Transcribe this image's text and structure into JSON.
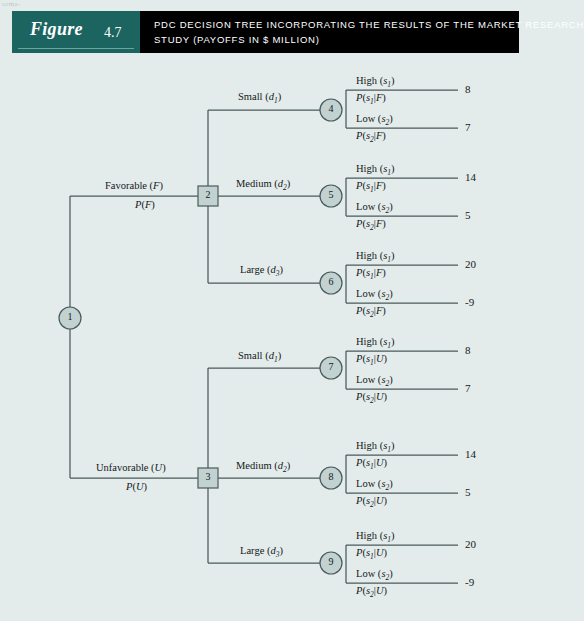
{
  "artifact_text": "orma-",
  "header": {
    "figure_word": "Figure",
    "figure_number": "4.7",
    "title_line1": "PDC DECISION TREE INCORPORATING THE RESULTS OF THE MARKET RESEARCH",
    "title_line2": "STUDY (PAYOFFS IN $ MILLION)",
    "colors": {
      "figure_block": "#1c6460",
      "title_block": "#000000",
      "page_background": "#e3eceb"
    }
  },
  "tree": {
    "nodes": [
      {
        "id": "1",
        "label": "1",
        "shape": "circle",
        "x": 70,
        "y": 318
      },
      {
        "id": "2",
        "label": "2",
        "shape": "square",
        "x": 208,
        "y": 196
      },
      {
        "id": "3",
        "label": "3",
        "shape": "square",
        "x": 208,
        "y": 478
      },
      {
        "id": "4",
        "label": "4",
        "shape": "circle",
        "x": 331,
        "y": 110
      },
      {
        "id": "5",
        "label": "5",
        "shape": "circle",
        "x": 331,
        "y": 196
      },
      {
        "id": "6",
        "label": "6",
        "shape": "circle",
        "x": 331,
        "y": 283
      },
      {
        "id": "7",
        "label": "7",
        "shape": "circle",
        "x": 331,
        "y": 368
      },
      {
        "id": "8",
        "label": "8",
        "shape": "circle",
        "x": 331,
        "y": 478
      },
      {
        "id": "9",
        "label": "9",
        "shape": "circle",
        "x": 331,
        "y": 563
      }
    ],
    "market_research_branches": [
      {
        "above": "Favorable (F)",
        "above_html": "Favorable (<i>F</i>)",
        "below": "P(F)",
        "below_html": "<i>P</i>(<i>F</i>)",
        "x": 105,
        "y": 196
      },
      {
        "above": "Unfavorable (U)",
        "above_html": "Unfavorable (<i>U</i>)",
        "below": "P(U)",
        "below_html": "<i>P</i>(<i>U</i>)",
        "x": 96,
        "y": 478
      }
    ],
    "decision_branches": [
      {
        "label": "Small (d1)",
        "label_html": "Small (<i>d</i><sub>1</sub>)",
        "x": 238,
        "y": 97
      },
      {
        "label": "Medium (d2)",
        "label_html": "Medium (<i>d</i><sub>2</sub>)",
        "x": 236,
        "y": 184
      },
      {
        "label": "Large (d3)",
        "label_html": "Large (<i>d</i><sub>3</sub>)",
        "x": 240,
        "y": 270
      },
      {
        "label": "Small (d1)",
        "label_html": "Small (<i>d</i><sub>1</sub>)",
        "x": 238,
        "y": 356
      },
      {
        "label": "Medium (d2)",
        "label_html": "Medium (<i>d</i><sub>2</sub>)",
        "x": 236,
        "y": 466
      },
      {
        "label": "Large (d3)",
        "label_html": "Large (<i>d</i><sub>3</sub>)",
        "x": 240,
        "y": 551
      }
    ],
    "outcome_branches": [
      {
        "node": "4",
        "state_html": "High (<i>s</i><sub>1</sub>)",
        "state": "High (s1)",
        "prob_html": "<i>P</i>(<i>s</i><sub>1</sub>|<i>F</i>)",
        "prob": "P(s1|F)",
        "payoff": "8",
        "line_y": 90,
        "label_x": 356,
        "payoff_x": 465
      },
      {
        "node": "4",
        "state_html": "Low (<i>s</i><sub>2</sub>)",
        "state": "Low (s2)",
        "prob_html": "<i>P</i>(<i>s</i><sub>2</sub>|<i>F</i>)",
        "prob": "P(s2|F)",
        "payoff": "7",
        "line_y": 128,
        "label_x": 356,
        "payoff_x": 465
      },
      {
        "node": "5",
        "state_html": "High (<i>s</i><sub>1</sub>)",
        "state": "High (s1)",
        "prob_html": "<i>P</i>(<i>s</i><sub>1</sub>|<i>F</i>)",
        "prob": "P(s1|F)",
        "payoff": "14",
        "line_y": 178,
        "label_x": 356,
        "payoff_x": 465
      },
      {
        "node": "5",
        "state_html": "Low (<i>s</i><sub>2</sub>)",
        "state": "Low (s2)",
        "prob_html": "<i>P</i>(<i>s</i><sub>2</sub>|<i>F</i>)",
        "prob": "P(s2|F)",
        "payoff": "5",
        "line_y": 216,
        "label_x": 356,
        "payoff_x": 465
      },
      {
        "node": "6",
        "state_html": "High (<i>s</i><sub>1</sub>)",
        "state": "High (s1)",
        "prob_html": "<i>P</i>(<i>s</i><sub>1</sub>|<i>F</i>)",
        "prob": "P(s1|F)",
        "payoff": "20",
        "line_y": 265,
        "label_x": 356,
        "payoff_x": 465
      },
      {
        "node": "6",
        "state_html": "Low (<i>s</i><sub>2</sub>)",
        "state": "Low (s2)",
        "prob_html": "<i>P</i>(<i>s</i><sub>2</sub>|<i>F</i>)",
        "prob": "P(s2|F)",
        "payoff": "-9",
        "line_y": 303,
        "label_x": 356,
        "payoff_x": 465
      },
      {
        "node": "7",
        "state_html": "High (<i>s</i><sub>1</sub>)",
        "state": "High (s1)",
        "prob_html": "<i>P</i>(<i>s</i><sub>1</sub>|<i>U</i>)",
        "prob": "P(s1|U)",
        "payoff": "8",
        "line_y": 351,
        "label_x": 356,
        "payoff_x": 465
      },
      {
        "node": "7",
        "state_html": "Low (<i>s</i><sub>2</sub>)",
        "state": "Low (s2)",
        "prob_html": "<i>P</i>(<i>s</i><sub>2</sub>|<i>U</i>)",
        "prob": "P(s2|U)",
        "payoff": "7",
        "line_y": 389,
        "label_x": 356,
        "payoff_x": 465
      },
      {
        "node": "8",
        "state_html": "High (<i>s</i><sub>1</sub>)",
        "state": "High (s1)",
        "prob_html": "<i>P</i>(<i>s</i><sub>1</sub>|<i>U</i>)",
        "prob": "P(s1|U)",
        "payoff": "14",
        "line_y": 455,
        "label_x": 356,
        "payoff_x": 465
      },
      {
        "node": "8",
        "state_html": "Low (<i>s</i><sub>2</sub>)",
        "state": "Low (s2)",
        "prob_html": "<i>P</i>(<i>s</i><sub>2</sub>|<i>U</i>)",
        "prob": "P(s2|U)",
        "payoff": "5",
        "line_y": 493,
        "label_x": 356,
        "payoff_x": 465
      },
      {
        "node": "9",
        "state_html": "High (<i>s</i><sub>1</sub>)",
        "state": "High (s1)",
        "prob_html": "<i>P</i>(<i>s</i><sub>1</sub>|<i>U</i>)",
        "prob": "P(s1|U)",
        "payoff": "20",
        "line_y": 545,
        "label_x": 356,
        "payoff_x": 465
      },
      {
        "node": "9",
        "state_html": "Low (<i>s</i><sub>2</sub>)",
        "state": "Low (s2)",
        "prob_html": "<i>P</i>(<i>s</i><sub>2</sub>|<i>U</i>)",
        "prob": "P(s2|U)",
        "payoff": "-9",
        "line_y": 583,
        "label_x": 356,
        "payoff_x": 465
      }
    ]
  }
}
